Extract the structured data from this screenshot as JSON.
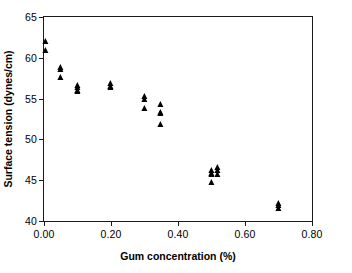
{
  "chart_data": {
    "type": "scatter",
    "title": "",
    "xlabel": "Gum concentration (%)",
    "ylabel": "Surface tension (dynes/cm)",
    "xlim": [
      0.0,
      0.8
    ],
    "ylim": [
      40,
      65
    ],
    "xticks": [
      0.0,
      0.2,
      0.4,
      0.6,
      0.8
    ],
    "xtick_labels": [
      "0.00",
      "0.20",
      "0.40",
      "0.60",
      "0.80"
    ],
    "yticks": [
      40,
      45,
      50,
      55,
      60,
      65
    ],
    "ytick_labels": [
      "40",
      "45",
      "50",
      "55",
      "60",
      "65"
    ],
    "grid": false,
    "legend": null,
    "marker": "triangle-up",
    "marker_color": "#000000",
    "series": [
      {
        "name": "Surface tension vs gum concentration",
        "points": [
          {
            "x": 0.005,
            "y": 62.1
          },
          {
            "x": 0.005,
            "y": 60.9
          },
          {
            "x": 0.05,
            "y": 58.9
          },
          {
            "x": 0.05,
            "y": 58.6
          },
          {
            "x": 0.05,
            "y": 57.6
          },
          {
            "x": 0.1,
            "y": 56.7
          },
          {
            "x": 0.1,
            "y": 56.4
          },
          {
            "x": 0.1,
            "y": 56.1
          },
          {
            "x": 0.1,
            "y": 55.9
          },
          {
            "x": 0.2,
            "y": 56.9
          },
          {
            "x": 0.2,
            "y": 56.6
          },
          {
            "x": 0.2,
            "y": 56.4
          },
          {
            "x": 0.3,
            "y": 55.3
          },
          {
            "x": 0.3,
            "y": 55.0
          },
          {
            "x": 0.3,
            "y": 53.9
          },
          {
            "x": 0.35,
            "y": 54.3
          },
          {
            "x": 0.35,
            "y": 53.4
          },
          {
            "x": 0.35,
            "y": 53.2
          },
          {
            "x": 0.35,
            "y": 51.9
          },
          {
            "x": 0.5,
            "y": 46.2
          },
          {
            "x": 0.5,
            "y": 45.9
          },
          {
            "x": 0.5,
            "y": 45.7
          },
          {
            "x": 0.5,
            "y": 44.8
          },
          {
            "x": 0.52,
            "y": 46.6
          },
          {
            "x": 0.52,
            "y": 46.2
          },
          {
            "x": 0.52,
            "y": 45.8
          },
          {
            "x": 0.7,
            "y": 42.2
          },
          {
            "x": 0.7,
            "y": 41.9
          },
          {
            "x": 0.7,
            "y": 41.6
          }
        ]
      }
    ]
  }
}
